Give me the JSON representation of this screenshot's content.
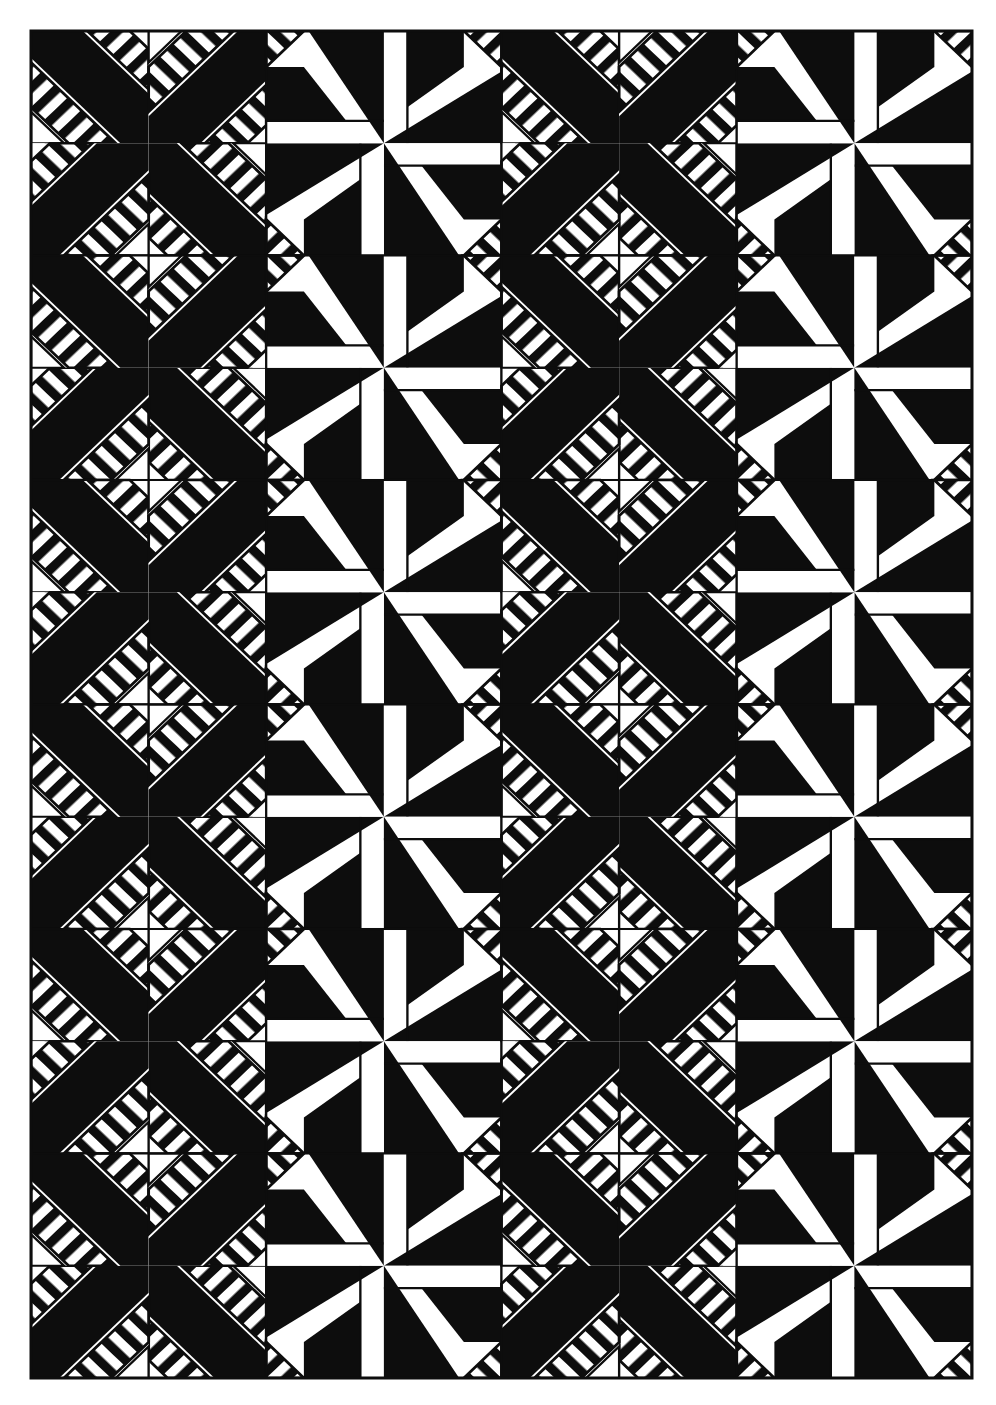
{
  "artwork": {
    "title": "Black and White Geometric Quilt Pattern",
    "kind": "quilt-block-grid",
    "canvas": {
      "width": 996,
      "height": 1405,
      "background": "#ffffff"
    },
    "palette": {
      "ink": "#0d0d0d",
      "paper": "#ffffff",
      "border": "#0d0d0d"
    },
    "border": {
      "label": "outer frame",
      "x": 31,
      "y": 31,
      "width": 941,
      "height": 1347,
      "stroke_width": 3
    },
    "grid": {
      "label": "block grid",
      "columns": 4,
      "rows": 6,
      "block_width": 235.25,
      "block_height": 224.5,
      "origin_x": 31,
      "origin_y": 31
    },
    "hatch": {
      "label": "45 degree stripe fill",
      "angle_degrees": 45,
      "period_px": 8,
      "stripe_px": 4
    },
    "block_types": {
      "A": "pinwheel with striped bands and solid arms",
      "B": "pinwheel with solid blades and striped corner triangles"
    },
    "block_layout": [
      [
        "A0",
        "B1",
        "A0",
        "B1"
      ],
      [
        "A2",
        "B3",
        "A2",
        "B3"
      ],
      [
        "A0",
        "B1",
        "A0",
        "B1"
      ],
      [
        "A2",
        "B3",
        "A2",
        "B3"
      ],
      [
        "A0",
        "B1",
        "A0",
        "B1"
      ],
      [
        "A2",
        "B3",
        "A2",
        "B3"
      ]
    ],
    "notes": {
      "symmetry": "4-fold rotational symmetry within each block",
      "seam_lines": "thin black outlines separate adjoining patches"
    }
  }
}
